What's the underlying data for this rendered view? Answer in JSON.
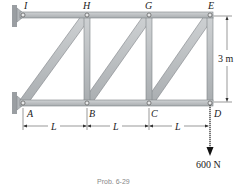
{
  "figure": {
    "type": "truss",
    "joints": {
      "top": [
        "I",
        "H",
        "G",
        "E"
      ],
      "bottom": [
        "A",
        "B",
        "C",
        "D"
      ]
    },
    "labels": {
      "I": "I",
      "H": "H",
      "G": "G",
      "E": "E",
      "A": "A",
      "B": "B",
      "C": "C",
      "D": "D"
    },
    "dimensions": {
      "height": "3 m",
      "spans": [
        "L",
        "L",
        "L"
      ]
    },
    "load": {
      "joint": "D",
      "value": "600 N",
      "direction": "down"
    },
    "supports": [
      "I",
      "A"
    ],
    "caption": "Prob. 6-29"
  },
  "colors": {
    "member": "#b9bdc0",
    "member_edge": "#7d8286",
    "wall": "#9a9ea2",
    "ink": "#222222"
  }
}
